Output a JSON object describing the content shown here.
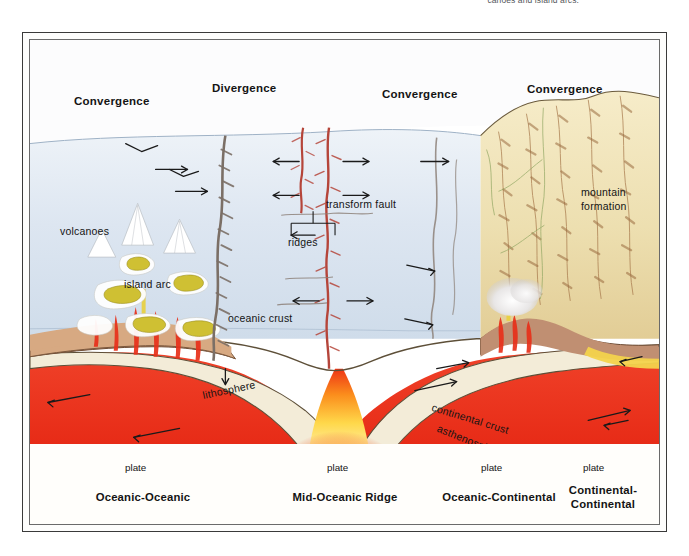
{
  "caption": {
    "text": "canoes and island arcs."
  },
  "figure": {
    "top_labels": [
      {
        "name": "convergence-left",
        "text": "Convergence",
        "x": 44,
        "y": 55
      },
      {
        "name": "divergence",
        "text": "Divergence",
        "x": 182,
        "y": 42
      },
      {
        "name": "convergence-mid",
        "text": "Convergence",
        "x": 352,
        "y": 48
      },
      {
        "name": "convergence-right",
        "text": "Convergence",
        "x": 497,
        "y": 43
      }
    ],
    "inner_labels": [
      {
        "name": "volcanoes",
        "text": "volcanoes",
        "x": 30,
        "y": 185,
        "size": "inl"
      },
      {
        "name": "island-arc",
        "text": "island arc",
        "x": 94,
        "y": 238,
        "size": "inl"
      },
      {
        "name": "oceanic-crust",
        "text": "oceanic crust",
        "x": 198,
        "y": 272,
        "size": "inl"
      },
      {
        "name": "ridges",
        "text": "ridges",
        "x": 258,
        "y": 196,
        "size": "inl"
      },
      {
        "name": "transform-fault",
        "text": "transform fault",
        "x": 296,
        "y": 158,
        "size": "inl"
      },
      {
        "name": "mountain-formation-line1",
        "text": "mountain",
        "x": 551,
        "y": 146,
        "size": "inl"
      },
      {
        "name": "mountain-formation-line2",
        "text": "formation",
        "x": 551,
        "y": 160,
        "size": "inl"
      },
      {
        "name": "magma",
        "text": "magma",
        "x": 293,
        "y": 405,
        "size": "inl"
      }
    ],
    "rotated_labels": [
      {
        "name": "lithosphere",
        "text": "lithosphere",
        "x": 174,
        "y": 349
      },
      {
        "name": "continental-crust",
        "text": "continental crust",
        "x": 404,
        "y": 361
      },
      {
        "name": "asthenosphere",
        "text": "asthenosphere",
        "x": 410,
        "y": 382
      }
    ],
    "plate_axis": {
      "label": "plate",
      "ticks": [
        14,
        212,
        418,
        520,
        622
      ],
      "segments": [
        {
          "name": "plate-segment-1",
          "label": "plate",
          "center": 113
        },
        {
          "name": "plate-segment-2",
          "label": "plate",
          "center": 315
        },
        {
          "name": "plate-segment-3",
          "label": "plate",
          "center": 469
        },
        {
          "name": "plate-segment-4",
          "label": "plate",
          "center": 571
        }
      ]
    },
    "footer_labels": [
      {
        "name": "footer-oceanic-oceanic",
        "lines": [
          "Oceanic-Oceanic"
        ],
        "center": 113
      },
      {
        "name": "footer-mid-oceanic-ridge",
        "lines": [
          "Mid-Oceanic Ridge"
        ],
        "center": 315
      },
      {
        "name": "footer-oceanic-continental",
        "lines": [
          "Oceanic-Continental"
        ],
        "center": 469
      },
      {
        "name": "footer-continental-continental",
        "lines": [
          "Continental-",
          "Continental"
        ],
        "center": 573
      }
    ]
  },
  "colors": {
    "ocean": "#dde6f0",
    "sky_haze": "#f2f5f9",
    "land_tan": "#f0e2bd",
    "land_sand": "#e8d5a8",
    "crust_brown": "#c69477",
    "litho_cream": "#f3ecd8",
    "asthenosphere_red": "#ec2a18",
    "magma_yellow": "#fde26a",
    "magma_white": "#fffdf2",
    "volcano_gold": "#cfc033",
    "frame": "#3a3a3a",
    "text": "#141414",
    "ridge_red": "#b5453a",
    "fault_gray": "#8d8179"
  }
}
